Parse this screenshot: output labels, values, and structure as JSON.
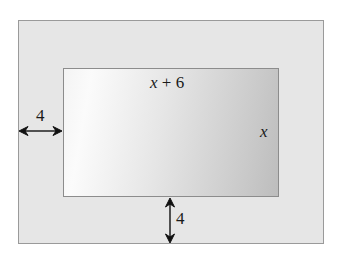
{
  "diagram": {
    "outer_rect": {
      "fill": "#e6e6e6",
      "stroke": "#9a9a9a"
    },
    "inner_rect": {
      "fill_light": "#fbfbfb",
      "fill_dark": "#bdbdbd",
      "stroke": "#8c8c8c"
    },
    "labels": {
      "top_width_var": "x",
      "top_width_rest": " + 6",
      "right_height": "x",
      "left_margin": "4",
      "bottom_margin": "4"
    },
    "arrows": {
      "left_margin": "horizontal double-headed arrow",
      "bottom_margin": "vertical double-headed arrow"
    }
  }
}
